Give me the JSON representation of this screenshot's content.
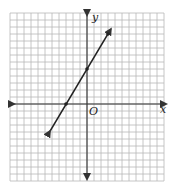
{
  "chart_data": {
    "type": "line",
    "title": "",
    "xlabel": "x",
    "ylabel": "y",
    "origin_label": "O",
    "grid": true,
    "xlim": [
      -11,
      11
    ],
    "ylim": [
      -11,
      13
    ],
    "series": [
      {
        "name": "line",
        "equation": "y = (5/3)x + 5",
        "slope": 1.6667,
        "intercept": 5,
        "x": [
          -5.3,
          -3,
          0,
          3,
          3.4
        ],
        "y": [
          -3.9,
          0,
          5,
          10,
          10.7
        ],
        "marked_points": [
          [
            -3,
            0
          ],
          [
            0,
            5
          ],
          [
            3,
            10
          ]
        ]
      }
    ]
  },
  "colors": {
    "grid": "#b8b8b8",
    "axis": "#333333",
    "line": "#222222"
  }
}
